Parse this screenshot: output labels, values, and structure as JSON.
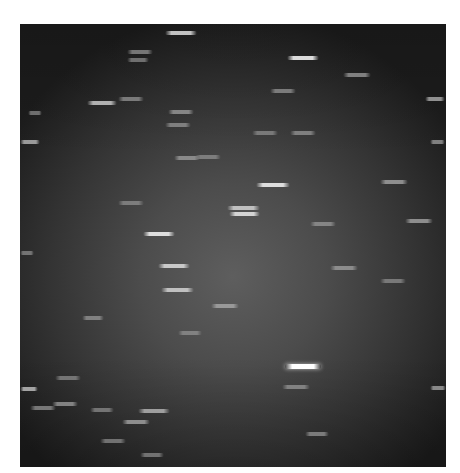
{
  "image": {
    "description": "Grayscale astronomical exposure showing horizontal star trails",
    "background_center": "#5e5e5e",
    "background_edge": "#1c1c1c",
    "streaks": [
      {
        "x": 165,
        "y": 33,
        "w": 32,
        "b": 0.75
      },
      {
        "x": 127,
        "y": 52,
        "w": 26,
        "b": 0.35
      },
      {
        "x": 127,
        "y": 60,
        "w": 22,
        "b": 0.3
      },
      {
        "x": 287,
        "y": 58,
        "w": 32,
        "b": 0.85
      },
      {
        "x": 343,
        "y": 75,
        "w": 28,
        "b": 0.4
      },
      {
        "x": 10,
        "y": 98,
        "w": 10,
        "b": 0.5
      },
      {
        "x": 87,
        "y": 103,
        "w": 30,
        "b": 0.65
      },
      {
        "x": 118,
        "y": 99,
        "w": 26,
        "b": 0.35
      },
      {
        "x": 270,
        "y": 91,
        "w": 26,
        "b": 0.35
      },
      {
        "x": 425,
        "y": 99,
        "w": 20,
        "b": 0.5
      },
      {
        "x": 28,
        "y": 113,
        "w": 14,
        "b": 0.3
      },
      {
        "x": 168,
        "y": 112,
        "w": 26,
        "b": 0.4
      },
      {
        "x": 165,
        "y": 125,
        "w": 26,
        "b": 0.35
      },
      {
        "x": 252,
        "y": 133,
        "w": 26,
        "b": 0.3
      },
      {
        "x": 290,
        "y": 133,
        "w": 26,
        "b": 0.35
      },
      {
        "x": 20,
        "y": 142,
        "w": 20,
        "b": 0.55
      },
      {
        "x": 195,
        "y": 157,
        "w": 26,
        "b": 0.3
      },
      {
        "x": 174,
        "y": 158,
        "w": 26,
        "b": 0.4
      },
      {
        "x": 430,
        "y": 142,
        "w": 15,
        "b": 0.4
      },
      {
        "x": 256,
        "y": 185,
        "w": 34,
        "b": 0.85
      },
      {
        "x": 380,
        "y": 182,
        "w": 28,
        "b": 0.45
      },
      {
        "x": 118,
        "y": 203,
        "w": 26,
        "b": 0.3
      },
      {
        "x": 227,
        "y": 208,
        "w": 33,
        "b": 0.7
      },
      {
        "x": 229,
        "y": 214,
        "w": 31,
        "b": 0.8
      },
      {
        "x": 310,
        "y": 224,
        "w": 26,
        "b": 0.35
      },
      {
        "x": 405,
        "y": 221,
        "w": 28,
        "b": 0.45
      },
      {
        "x": 143,
        "y": 234,
        "w": 32,
        "b": 0.85
      },
      {
        "x": 20,
        "y": 253,
        "w": 14,
        "b": 0.3
      },
      {
        "x": 158,
        "y": 266,
        "w": 32,
        "b": 0.75
      },
      {
        "x": 330,
        "y": 268,
        "w": 28,
        "b": 0.4
      },
      {
        "x": 161,
        "y": 290,
        "w": 33,
        "b": 0.7
      },
      {
        "x": 380,
        "y": 281,
        "w": 26,
        "b": 0.3
      },
      {
        "x": 211,
        "y": 306,
        "w": 28,
        "b": 0.45
      },
      {
        "x": 82,
        "y": 318,
        "w": 22,
        "b": 0.35
      },
      {
        "x": 178,
        "y": 333,
        "w": 24,
        "b": 0.3
      },
      {
        "x": 285,
        "y": 366,
        "w": 36,
        "b": 1.0
      },
      {
        "x": 282,
        "y": 387,
        "w": 28,
        "b": 0.35
      },
      {
        "x": 20,
        "y": 389,
        "w": 18,
        "b": 0.6
      },
      {
        "x": 430,
        "y": 388,
        "w": 16,
        "b": 0.45
      },
      {
        "x": 55,
        "y": 378,
        "w": 26,
        "b": 0.3
      },
      {
        "x": 30,
        "y": 408,
        "w": 26,
        "b": 0.35
      },
      {
        "x": 52,
        "y": 404,
        "w": 26,
        "b": 0.4
      },
      {
        "x": 90,
        "y": 410,
        "w": 24,
        "b": 0.3
      },
      {
        "x": 138,
        "y": 411,
        "w": 32,
        "b": 0.55
      },
      {
        "x": 122,
        "y": 422,
        "w": 28,
        "b": 0.45
      },
      {
        "x": 305,
        "y": 434,
        "w": 24,
        "b": 0.35
      },
      {
        "x": 100,
        "y": 441,
        "w": 26,
        "b": 0.3
      },
      {
        "x": 140,
        "y": 455,
        "w": 24,
        "b": 0.3
      }
    ]
  }
}
